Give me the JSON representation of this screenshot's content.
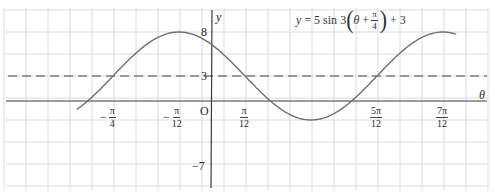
{
  "chart_data": {
    "type": "line",
    "equation": {
      "lhs": "y",
      "equals": "=",
      "amplitude": "5",
      "func": "sin",
      "freq": "3",
      "var": "θ",
      "plus": "+",
      "phase_num": "π",
      "phase_den": "4",
      "offset_sign": "+",
      "offset": "3"
    },
    "params": {
      "amplitude": 5,
      "frequency": 3,
      "phase_shift": 0.7853981634,
      "vertical_shift": 3
    },
    "xlabel": "θ",
    "ylabel": "y",
    "origin_label": "O",
    "x_ticks": [
      {
        "sign": "−",
        "num": "π",
        "den": "4",
        "value": -0.7853981634
      },
      {
        "sign": "−",
        "num": "π",
        "den": "12",
        "value": -0.2617993878
      },
      {
        "sign": "",
        "num": "π",
        "den": "12",
        "value": 0.2617993878
      },
      {
        "sign": "",
        "num": "5π",
        "den": "12",
        "value": 1.308996939
      },
      {
        "sign": "",
        "num": "7π",
        "den": "12",
        "value": 1.8325957146
      }
    ],
    "y_ticks": [
      {
        "label": "8",
        "value": 8
      },
      {
        "label": "3",
        "value": 3
      },
      {
        "label": "−7",
        "value": -7
      }
    ],
    "midline": {
      "value": 3,
      "style": "dashed"
    },
    "xlim": [
      -1.0734,
      1.9373
    ],
    "ylim": [
      -9.8,
      11.5
    ],
    "grid": true,
    "key_points": [
      {
        "theta": "-π/12",
        "y": 8,
        "kind": "maximum"
      },
      {
        "theta": "π/4",
        "y": -2,
        "kind": "minimum"
      },
      {
        "theta": "7π/12",
        "y": 8,
        "kind": "maximum"
      },
      {
        "theta": "-π/4",
        "y": 3,
        "kind": "midline-crossing"
      },
      {
        "theta": "π/12",
        "y": 3,
        "kind": "midline-crossing"
      },
      {
        "theta": "5π/12",
        "y": 3,
        "kind": "midline-crossing"
      }
    ],
    "colors": {
      "curve": "#6e6e6e",
      "axis": "#3a3a3a",
      "grid": "#dcdcdc",
      "midline": "#444444"
    }
  }
}
